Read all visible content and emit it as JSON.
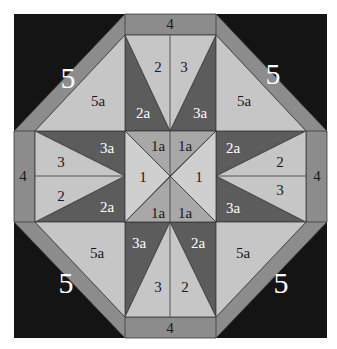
{
  "colors": {
    "background": "#ffffff",
    "piece_5": "#141414",
    "piece_4": "#8c8c8c",
    "band_5": "#8c8c8c",
    "light": "#c6c6c6",
    "dark": "#5c5c5c",
    "piece_1a": "#a8a8a8",
    "piece_1": "#cfcfcf",
    "text_dark": "#1a1a1a",
    "text_light": "#ffffff",
    "outline": "#3a3a3a"
  },
  "labels": {
    "four_top": "4",
    "four_bottom": "4",
    "four_left": "4",
    "four_right": "4",
    "five_tl": "5",
    "five_tr": "5",
    "five_bl": "5",
    "five_br": "5",
    "fivea_tl": "5a",
    "fivea_tr": "5a",
    "fivea_bl": "5a",
    "fivea_br": "5a",
    "top_left_light": "2",
    "top_right_light": "3",
    "top_left_dark": "2a",
    "top_right_dark": "3a",
    "bottom_left_light": "3",
    "bottom_right_light": "2",
    "bottom_left_dark": "3a",
    "bottom_right_dark": "2a",
    "left_top_light": "3",
    "left_bottom_light": "2",
    "left_top_dark": "3a",
    "left_bottom_dark": "2a",
    "right_top_light": "2",
    "right_bottom_light": "3",
    "right_top_dark": "2a",
    "right_bottom_dark": "3a",
    "center_left": "1",
    "center_right": "1",
    "center_tl": "1a",
    "center_tr": "1a",
    "center_bl": "1a",
    "center_br": "1a"
  }
}
